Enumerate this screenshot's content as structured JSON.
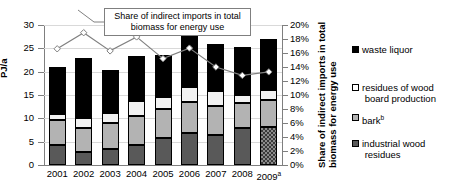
{
  "chart_data": {
    "type": "bar",
    "title": "",
    "subtitle": "",
    "xlabel": "",
    "ylabel": "PJ/a",
    "y2label": "Share of indirect imports in total biomass for energy use",
    "ylim": [
      0,
      30
    ],
    "y2lim": [
      0,
      0.2
    ],
    "grid": true,
    "legend_position": "right",
    "categories": [
      "2001",
      "2002",
      "2003",
      "2004",
      "2005",
      "2006",
      "2007",
      "2008",
      "2009"
    ],
    "category_superscripts": [
      "",
      "",
      "",
      "",
      "",
      "",
      "",
      "",
      "a"
    ],
    "stacked": true,
    "stack_order_bottom_to_top": [
      "industrial wood residues",
      "bark",
      "residues of wood board production",
      "waste liquor"
    ],
    "series": [
      {
        "name": "industrial wood residues",
        "axis": "left",
        "color": "#595959",
        "pattern_by_category": [
          "solid",
          "solid",
          "solid",
          "solid",
          "solid",
          "solid",
          "solid",
          "solid",
          "hatched"
        ],
        "values": [
          4.3,
          2.8,
          3.5,
          4.2,
          5.7,
          6.8,
          6.5,
          8.0,
          8.2
        ]
      },
      {
        "name": "bark",
        "axis": "left",
        "color": "#b3b3b3",
        "values": [
          5.3,
          5.1,
          5.4,
          6.3,
          6.3,
          6.8,
          6.2,
          5.3,
          5.8
        ]
      },
      {
        "name": "residues of wood board production",
        "axis": "left",
        "color": "#f2f2f2",
        "values": [
          1.4,
          2.2,
          2.3,
          3.2,
          2.5,
          3.2,
          3.1,
          1.6,
          2.0
        ]
      },
      {
        "name": "waste liquor",
        "axis": "left",
        "color": "#000000",
        "values": [
          10.0,
          12.9,
          9.1,
          9.6,
          9.0,
          11.2,
          10.2,
          10.4,
          11.0
        ]
      },
      {
        "name": "Share of indirect imports in total biomass for energy use",
        "type": "line",
        "axis": "right",
        "color": "#808080",
        "marker": "diamond-open",
        "values": [
          16.6,
          18.9,
          16.3,
          18.3,
          15.2,
          16.7,
          14.0,
          12.8,
          13.3
        ],
        "value_unit": "%"
      }
    ],
    "totals": [
      21.0,
      23.0,
      20.3,
      23.3,
      23.5,
      28.0,
      26.0,
      25.3,
      27.0
    ],
    "y_ticks": [
      "0",
      "5",
      "10",
      "15",
      "20",
      "25",
      "30"
    ],
    "y2_ticks": [
      "0%",
      "2%",
      "4%",
      "6%",
      "8%",
      "10%",
      "12%",
      "14%",
      "16%",
      "18%",
      "20%"
    ],
    "annotation": {
      "text_line1": "Share of indirect imports in",
      "text_line2": "total biomass for energy use"
    }
  },
  "axes": {
    "left_title": "PJ/a",
    "right_title_line1": "Share of indirect imports in total",
    "right_title_line2": "biomass for energy use"
  },
  "legend": {
    "items": [
      {
        "label": "waste liquor",
        "marker": "filled-black-square"
      },
      {
        "label": "residues of wood",
        "label2": "board production",
        "marker": "open-white-square"
      },
      {
        "label": "bark",
        "superscript": "b",
        "marker": "light-grey-square"
      },
      {
        "label": "industrial wood",
        "label2": "residues",
        "marker": "dark-grey-square"
      }
    ]
  }
}
